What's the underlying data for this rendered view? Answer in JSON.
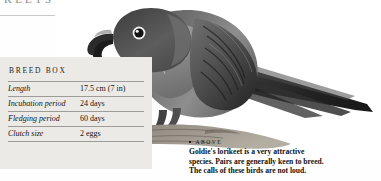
{
  "page": {
    "running_head": "KEETS"
  },
  "photo": {
    "alt_name": "goldies-lorikeet-photo",
    "subject": "Goldie's lorikeet perched on a branch",
    "palette": {
      "feather_dark": "#4a4a4a",
      "feather_mid": "#7d7d7d",
      "feather_light": "#b9b9b9",
      "branch": "#8a857c",
      "background": "#ffffff"
    }
  },
  "breed_box": {
    "title": "BREED BOX",
    "rows": [
      {
        "label": "Length",
        "value": "17.5 cm (7 in)"
      },
      {
        "label": "Incubation period",
        "value": "24 days"
      },
      {
        "label": "Fledging period",
        "value": "60 days"
      },
      {
        "label": "Clutch size",
        "value": "2 eggs"
      }
    ]
  },
  "caption": {
    "heading": "ABOVE",
    "line1": "Goldie's lorikeet is a very attractive",
    "line2": "species. Pairs are generally keen to breed.",
    "line3": "The calls of these birds are not loud."
  }
}
